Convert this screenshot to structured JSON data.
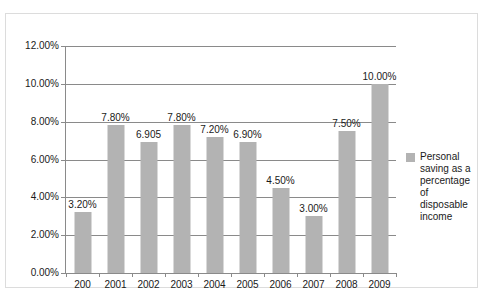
{
  "chart_data": {
    "type": "bar",
    "title": "",
    "xlabel": "",
    "ylabel": "",
    "ylim": [
      0,
      12
    ],
    "ytick_step": 2,
    "grid": true,
    "legend_position": "right",
    "categories": [
      "200",
      "2001",
      "2002",
      "2003",
      "2004",
      "2005",
      "2006",
      "2007",
      "2008",
      "2009"
    ],
    "values": [
      3.2,
      7.8,
      6.905,
      7.8,
      7.2,
      6.9,
      4.5,
      3.0,
      7.5,
      10.0
    ],
    "data_labels": [
      "3.20%",
      "7.80%",
      "6.905",
      "7.80%",
      "7.20%",
      "6.90%",
      "4.50%",
      "3.00%",
      "7.50%",
      "10.00%"
    ],
    "ytick_labels": [
      "0.00%",
      "2.00%",
      "4.00%",
      "6.00%",
      "8.00%",
      "10.00%",
      "12.00%"
    ],
    "ytick_values": [
      0,
      2,
      4,
      6,
      8,
      10,
      12
    ],
    "series": [
      {
        "name": "Personal saving as a percentage of disposable income",
        "color": "#b3b3b3",
        "values": [
          3.2,
          7.8,
          6.905,
          7.8,
          7.2,
          6.9,
          4.5,
          3.0,
          7.5,
          10.0
        ]
      }
    ]
  },
  "legend": {
    "label": "Personal saving as a percentage of disposable income",
    "swatch_color": "#b3b3b3"
  },
  "caption": {
    "text": ""
  },
  "colors": {
    "bar": "#b3b3b3",
    "axis": "#8a8a8a",
    "gridline": "#8a8a8a",
    "frame": "#dcdcdc",
    "text": "#1a1a1a"
  }
}
